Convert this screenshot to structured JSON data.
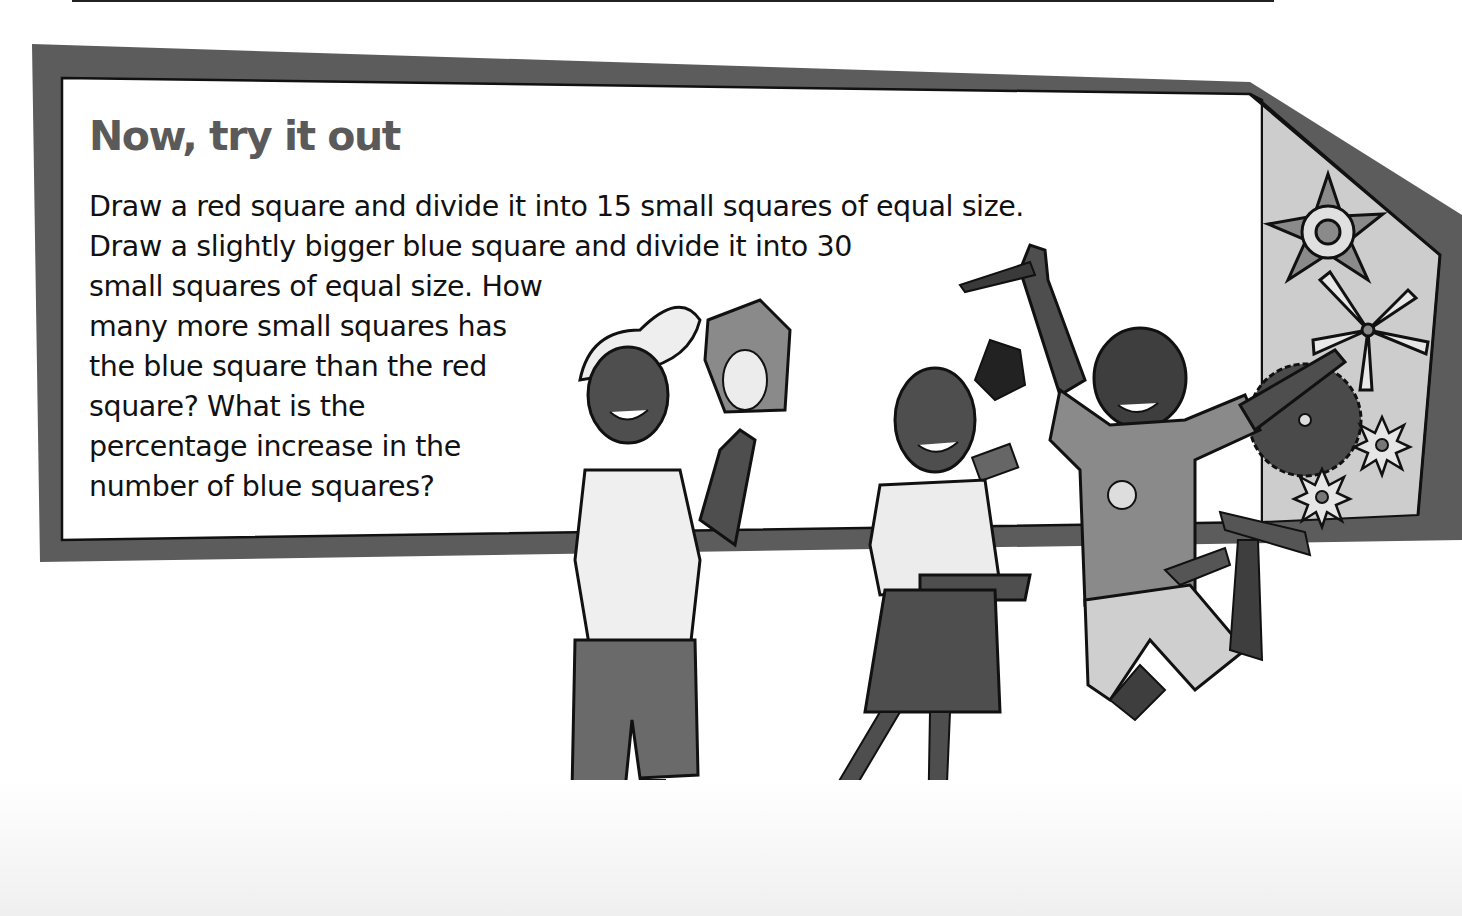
{
  "activity": {
    "title": "Now, try it out",
    "lines": [
      "Draw a red square and divide it into 15 small squares of equal size.",
      "Draw a slightly bigger blue square and divide it into 30",
      "small squares of equal size. How",
      "many more small squares has",
      "the blue square than the red",
      "square? What is the",
      "percentage increase in the",
      "number of blue squares?"
    ]
  },
  "illustration": {
    "description": "Three cartoon children standing in front of the banner; boy with cap holding an owl, girl with ponytail holding a phone, jumping boy holding a saw; decorative gear and star shapes on the right panel",
    "characters": [
      "boy-with-owl",
      "girl-with-phone",
      "jumping-boy-with-saw"
    ]
  },
  "colors": {
    "frame": "#5c5c5c",
    "panel": "#ffffff",
    "side_panel": "#cfcfcf",
    "title": "#5a5a5a",
    "text": "#111111"
  }
}
